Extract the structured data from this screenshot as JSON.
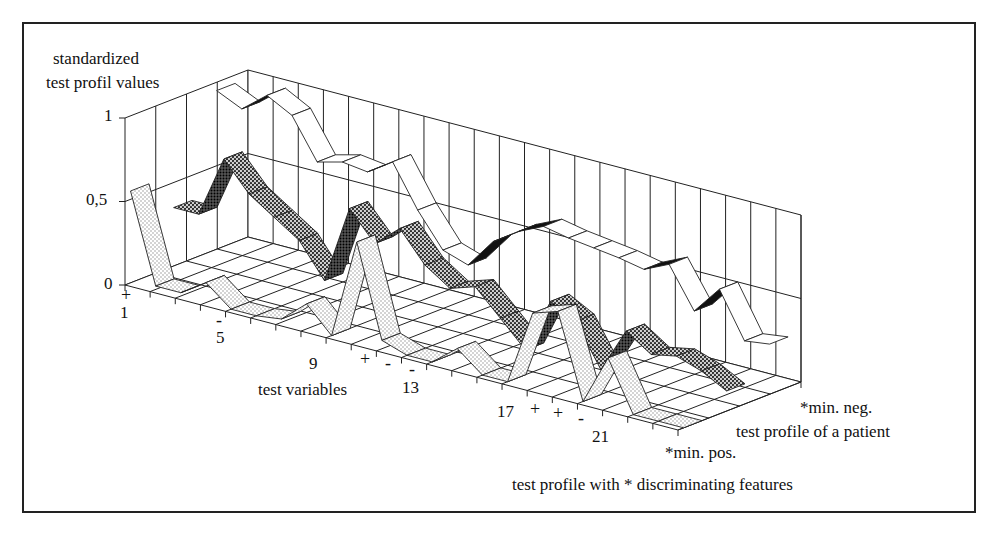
{
  "chart_data": {
    "type": "line",
    "subtype": "3d-ribbon",
    "title": "",
    "zlabel": "standardized test profil values",
    "xlabel": "test variables",
    "ylabel": "",
    "ylim": [
      0,
      1
    ],
    "y_ticks": [
      "0",
      "0,5",
      "1"
    ],
    "x_tick_labels": [
      "1",
      "5",
      "9",
      "13",
      "17",
      "21"
    ],
    "x": [
      1,
      2,
      3,
      4,
      5,
      6,
      7,
      8,
      9,
      10,
      11,
      12,
      13,
      14,
      15,
      16,
      17,
      18,
      19,
      20,
      21,
      22,
      23
    ],
    "series": [
      {
        "name": "*min. pos.",
        "depth": 0.12,
        "fill": "dotted-light",
        "values": [
          0.55,
          0.02,
          0.02,
          0.12,
          0.0,
          0.0,
          0.02,
          0.15,
          0.0,
          0.6,
          0.05,
          0.0,
          0.0,
          0.12,
          0.0,
          0.0,
          0.45,
          0.5,
          0.0,
          0.3,
          0.0,
          0.0,
          0.0
        ]
      },
      {
        "name": "test profile of a patient",
        "depth": 0.47,
        "fill": "dotted-dark",
        "values": [
          0.35,
          0.35,
          0.72,
          0.55,
          0.45,
          0.35,
          0.15,
          0.62,
          0.45,
          0.58,
          0.4,
          0.3,
          0.35,
          0.2,
          0.05,
          0.38,
          0.3,
          0.05,
          0.32,
          0.22,
          0.25,
          0.2,
          0.12
        ]
      },
      {
        "name": "*min. neg.",
        "depth": 0.82,
        "fill": "white",
        "values": [
          0.95,
          0.88,
          1.0,
          0.92,
          0.68,
          0.72,
          0.7,
          0.8,
          0.55,
          0.35,
          0.3,
          0.48,
          0.58,
          0.65,
          0.62,
          0.6,
          0.58,
          0.55,
          0.62,
          0.38,
          0.55,
          0.28,
          0.3
        ]
      }
    ],
    "feature_markers": [
      {
        "x": 1,
        "sign": "+"
      },
      {
        "x": 5,
        "sign": "-"
      },
      {
        "x": 10,
        "sign": "+"
      },
      {
        "x": 11,
        "sign": "-"
      },
      {
        "x": 12,
        "sign": "-"
      },
      {
        "x": 17,
        "sign": "+"
      },
      {
        "x": 18,
        "sign": "+"
      },
      {
        "x": 19,
        "sign": "-"
      }
    ],
    "legend": [
      "*min. neg.",
      "test profile of a patient",
      "*min. pos."
    ],
    "caption": "test profile with * discriminating features",
    "grid": true
  },
  "labels": {
    "zlabel_line1": "standardized",
    "zlabel_line2": "test profil values",
    "ytick_1": "1",
    "ytick_05": "0,5",
    "ytick_0": "0",
    "xtick_1": "1",
    "xtick_5": "5",
    "xtick_9": "9",
    "xtick_13": "13",
    "xtick_17": "17",
    "xtick_21": "21",
    "xlabel": "test variables",
    "series_back": "*min. neg.",
    "series_mid": "test profile of a patient",
    "series_front": "*min. pos.",
    "caption": "test profile with * discriminating features",
    "plus": "+",
    "minus": "-"
  }
}
